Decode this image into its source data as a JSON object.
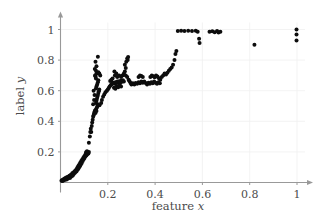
{
  "chart_data": {
    "type": "scatter",
    "title": "",
    "xlabel": "feature x",
    "ylabel": "label y",
    "xlim": [
      0,
      1.04
    ],
    "ylim": [
      0,
      1.06
    ],
    "xticks": [
      0.2,
      0.4,
      0.6,
      0.8,
      1
    ],
    "xtick_labels": [
      "0.2",
      "0.4",
      "0.6",
      "0.8",
      "1"
    ],
    "yticks": [
      0.2,
      0.4,
      0.6,
      0.8,
      1
    ],
    "ytick_labels": [
      "0.2",
      "0.4",
      "0.6",
      "0.8",
      "1"
    ],
    "grid": true,
    "grid_color": "#f0f0f0",
    "axis_color": "#999999",
    "marker_color": "#0d0d0d",
    "marker_size": 4,
    "legend": null,
    "series": [
      {
        "name": "samples",
        "points": [
          [
            0.004,
            0.012
          ],
          [
            0.007,
            0.016
          ],
          [
            0.009,
            0.01
          ],
          [
            0.012,
            0.02
          ],
          [
            0.014,
            0.014
          ],
          [
            0.016,
            0.024
          ],
          [
            0.018,
            0.018
          ],
          [
            0.02,
            0.028
          ],
          [
            0.022,
            0.022
          ],
          [
            0.024,
            0.032
          ],
          [
            0.026,
            0.02
          ],
          [
            0.028,
            0.03
          ],
          [
            0.03,
            0.036
          ],
          [
            0.032,
            0.026
          ],
          [
            0.034,
            0.04
          ],
          [
            0.036,
            0.034
          ],
          [
            0.038,
            0.044
          ],
          [
            0.04,
            0.03
          ],
          [
            0.042,
            0.048
          ],
          [
            0.044,
            0.038
          ],
          [
            0.046,
            0.052
          ],
          [
            0.048,
            0.042
          ],
          [
            0.05,
            0.06
          ],
          [
            0.052,
            0.046
          ],
          [
            0.054,
            0.064
          ],
          [
            0.056,
            0.056
          ],
          [
            0.058,
            0.07
          ],
          [
            0.06,
            0.062
          ],
          [
            0.062,
            0.076
          ],
          [
            0.064,
            0.068
          ],
          [
            0.066,
            0.084
          ],
          [
            0.068,
            0.074
          ],
          [
            0.07,
            0.09
          ],
          [
            0.072,
            0.1
          ],
          [
            0.074,
            0.086
          ],
          [
            0.076,
            0.11
          ],
          [
            0.078,
            0.096
          ],
          [
            0.08,
            0.12
          ],
          [
            0.082,
            0.106
          ],
          [
            0.084,
            0.13
          ],
          [
            0.086,
            0.118
          ],
          [
            0.088,
            0.14
          ],
          [
            0.09,
            0.128
          ],
          [
            0.092,
            0.15
          ],
          [
            0.094,
            0.14
          ],
          [
            0.096,
            0.16
          ],
          [
            0.098,
            0.152
          ],
          [
            0.1,
            0.17
          ],
          [
            0.102,
            0.162
          ],
          [
            0.104,
            0.18
          ],
          [
            0.106,
            0.172
          ],
          [
            0.108,
            0.188
          ],
          [
            0.11,
            0.178
          ],
          [
            0.112,
            0.192
          ],
          [
            0.114,
            0.186
          ],
          [
            0.116,
            0.196
          ],
          [
            0.118,
            0.19
          ],
          [
            0.12,
            0.2
          ],
          [
            0.108,
            0.198
          ],
          [
            0.112,
            0.205
          ],
          [
            0.12,
            0.26
          ],
          [
            0.124,
            0.3
          ],
          [
            0.126,
            0.33
          ],
          [
            0.128,
            0.352
          ],
          [
            0.13,
            0.33
          ],
          [
            0.132,
            0.37
          ],
          [
            0.134,
            0.392
          ],
          [
            0.136,
            0.41
          ],
          [
            0.138,
            0.43
          ],
          [
            0.14,
            0.44
          ],
          [
            0.142,
            0.452
          ],
          [
            0.144,
            0.462
          ],
          [
            0.146,
            0.47
          ],
          [
            0.148,
            0.455
          ],
          [
            0.15,
            0.478
          ],
          [
            0.152,
            0.468
          ],
          [
            0.154,
            0.49
          ],
          [
            0.156,
            0.5
          ],
          [
            0.158,
            0.512
          ],
          [
            0.15,
            0.52
          ],
          [
            0.152,
            0.535
          ],
          [
            0.154,
            0.548
          ],
          [
            0.156,
            0.56
          ],
          [
            0.158,
            0.572
          ],
          [
            0.16,
            0.585
          ],
          [
            0.162,
            0.596
          ],
          [
            0.164,
            0.608
          ],
          [
            0.15,
            0.615
          ],
          [
            0.152,
            0.628
          ],
          [
            0.155,
            0.64
          ],
          [
            0.158,
            0.655
          ],
          [
            0.16,
            0.668
          ],
          [
            0.15,
            0.68
          ],
          [
            0.148,
            0.692
          ],
          [
            0.146,
            0.7
          ],
          [
            0.152,
            0.71
          ],
          [
            0.156,
            0.715
          ],
          [
            0.16,
            0.72
          ],
          [
            0.164,
            0.712
          ],
          [
            0.168,
            0.7
          ],
          [
            0.15,
            0.73
          ],
          [
            0.145,
            0.742
          ],
          [
            0.152,
            0.76
          ],
          [
            0.148,
            0.79
          ],
          [
            0.158,
            0.822
          ],
          [
            0.14,
            0.6
          ],
          [
            0.144,
            0.572
          ],
          [
            0.142,
            0.54
          ],
          [
            0.138,
            0.512
          ],
          [
            0.165,
            0.505
          ],
          [
            0.172,
            0.52
          ],
          [
            0.175,
            0.54
          ],
          [
            0.18,
            0.56
          ],
          [
            0.185,
            0.575
          ],
          [
            0.19,
            0.59
          ],
          [
            0.196,
            0.6
          ],
          [
            0.2,
            0.608
          ],
          [
            0.204,
            0.618
          ],
          [
            0.208,
            0.628
          ],
          [
            0.212,
            0.636
          ],
          [
            0.216,
            0.642
          ],
          [
            0.22,
            0.648
          ],
          [
            0.224,
            0.652
          ],
          [
            0.228,
            0.646
          ],
          [
            0.232,
            0.656
          ],
          [
            0.236,
            0.65
          ],
          [
            0.24,
            0.66
          ],
          [
            0.244,
            0.655
          ],
          [
            0.248,
            0.662
          ],
          [
            0.252,
            0.65
          ],
          [
            0.256,
            0.665
          ],
          [
            0.26,
            0.658
          ],
          [
            0.264,
            0.668
          ],
          [
            0.268,
            0.66
          ],
          [
            0.21,
            0.664
          ],
          [
            0.215,
            0.672
          ],
          [
            0.22,
            0.68
          ],
          [
            0.226,
            0.62
          ],
          [
            0.232,
            0.612
          ],
          [
            0.238,
            0.63
          ],
          [
            0.244,
            0.622
          ],
          [
            0.25,
            0.636
          ],
          [
            0.256,
            0.628
          ],
          [
            0.23,
            0.7
          ],
          [
            0.236,
            0.712
          ],
          [
            0.228,
            0.726
          ],
          [
            0.24,
            0.69
          ],
          [
            0.248,
            0.7
          ],
          [
            0.256,
            0.69
          ],
          [
            0.262,
            0.7
          ],
          [
            0.268,
            0.712
          ],
          [
            0.272,
            0.726
          ],
          [
            0.276,
            0.748
          ],
          [
            0.272,
            0.77
          ],
          [
            0.278,
            0.79
          ],
          [
            0.282,
            0.81
          ],
          [
            0.286,
            0.82
          ],
          [
            0.284,
            0.8
          ],
          [
            0.276,
            0.7
          ],
          [
            0.282,
            0.69
          ],
          [
            0.288,
            0.672
          ],
          [
            0.292,
            0.662
          ],
          [
            0.296,
            0.65
          ],
          [
            0.3,
            0.64
          ],
          [
            0.306,
            0.648
          ],
          [
            0.312,
            0.64
          ],
          [
            0.318,
            0.65
          ],
          [
            0.324,
            0.645
          ],
          [
            0.33,
            0.655
          ],
          [
            0.336,
            0.648
          ],
          [
            0.342,
            0.66
          ],
          [
            0.348,
            0.652
          ],
          [
            0.33,
            0.69
          ],
          [
            0.336,
            0.7
          ],
          [
            0.342,
            0.696
          ],
          [
            0.348,
            0.69
          ],
          [
            0.354,
            0.66
          ],
          [
            0.36,
            0.65
          ],
          [
            0.366,
            0.64
          ],
          [
            0.372,
            0.652
          ],
          [
            0.378,
            0.645
          ],
          [
            0.384,
            0.655
          ],
          [
            0.39,
            0.648
          ],
          [
            0.396,
            0.66
          ],
          [
            0.402,
            0.652
          ],
          [
            0.408,
            0.645
          ],
          [
            0.414,
            0.655
          ],
          [
            0.42,
            0.648
          ],
          [
            0.38,
            0.69
          ],
          [
            0.386,
            0.7
          ],
          [
            0.392,
            0.694
          ],
          [
            0.398,
            0.688
          ],
          [
            0.404,
            0.7
          ],
          [
            0.41,
            0.692
          ],
          [
            0.416,
            0.682
          ],
          [
            0.422,
            0.672
          ],
          [
            0.428,
            0.69
          ],
          [
            0.434,
            0.7
          ],
          [
            0.44,
            0.712
          ],
          [
            0.446,
            0.706
          ],
          [
            0.452,
            0.718
          ],
          [
            0.458,
            0.73
          ],
          [
            0.464,
            0.742
          ],
          [
            0.47,
            0.752
          ],
          [
            0.476,
            0.77
          ],
          [
            0.482,
            0.8
          ],
          [
            0.486,
            0.84
          ],
          [
            0.49,
            0.86
          ],
          [
            0.496,
            0.99
          ],
          [
            0.51,
            0.992
          ],
          [
            0.524,
            0.99
          ],
          [
            0.54,
            0.992
          ],
          [
            0.556,
            0.99
          ],
          [
            0.572,
            0.992
          ],
          [
            0.58,
            0.985
          ],
          [
            0.586,
            0.94
          ],
          [
            0.588,
            0.912
          ],
          [
            0.63,
            0.985
          ],
          [
            0.642,
            0.988
          ],
          [
            0.652,
            0.982
          ],
          [
            0.662,
            0.99
          ],
          [
            0.668,
            0.98
          ],
          [
            0.676,
            0.986
          ],
          [
            0.82,
            0.9
          ],
          [
            0.998,
            1.0
          ],
          [
            0.998,
            0.968
          ],
          [
            0.998,
            0.928
          ]
        ]
      }
    ]
  },
  "axes": {
    "x_axis_name": "x-axis",
    "y_axis_name": "y-axis"
  }
}
